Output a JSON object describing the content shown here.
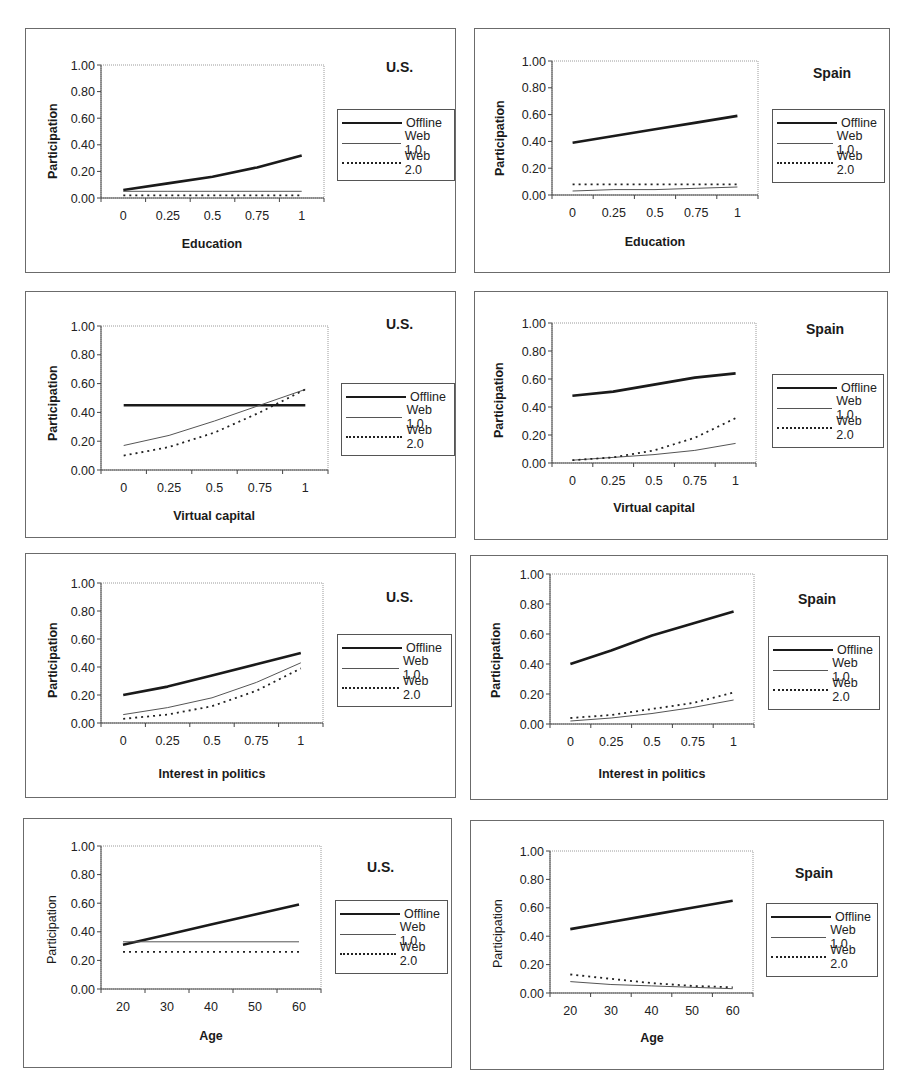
{
  "legend": {
    "offline": "Offline",
    "web1": "Web 1.0",
    "web2": "Web 2.0"
  },
  "colors": {
    "offline": "#1a1a1a",
    "web1": "#555555",
    "web2": "#222222",
    "panel_border": "#6b6b6b"
  },
  "panels": [
    {
      "country": "U.S.",
      "xlabel": "Education",
      "ylabel": "Participation"
    },
    {
      "country": "Spain",
      "xlabel": "Education",
      "ylabel": "Participation"
    },
    {
      "country": "U.S.",
      "xlabel": "Virtual capital",
      "ylabel": "Participation"
    },
    {
      "country": "Spain",
      "xlabel": "Virtual capital",
      "ylabel": "Participation"
    },
    {
      "country": "U.S.",
      "xlabel": "Interest in politics",
      "ylabel": "Participation"
    },
    {
      "country": "Spain",
      "xlabel": "Interest in politics",
      "ylabel": "Participation"
    },
    {
      "country": "U.S.",
      "xlabel": "Age",
      "ylabel": "Participation"
    },
    {
      "country": "Spain",
      "xlabel": "Age",
      "ylabel": "Participation"
    }
  ],
  "y_ticks": [
    "0.00",
    "0.20",
    "0.40",
    "0.60",
    "0.80",
    "1.00"
  ],
  "chart_data": [
    {
      "type": "line",
      "title": "U.S.",
      "xlabel": "Education",
      "ylabel": "Participation",
      "x": [
        0,
        0.25,
        0.5,
        0.75,
        1
      ],
      "x_tick_labels": [
        "0",
        "0.25",
        "0.5",
        "0.75",
        "1"
      ],
      "ylim": [
        0,
        1
      ],
      "legend_position": "right",
      "series": [
        {
          "name": "Offline",
          "values": [
            0.06,
            0.11,
            0.16,
            0.23,
            0.32
          ]
        },
        {
          "name": "Web 1.0",
          "values": [
            0.05,
            0.05,
            0.05,
            0.05,
            0.05
          ]
        },
        {
          "name": "Web 2.0",
          "values": [
            0.02,
            0.02,
            0.02,
            0.02,
            0.02
          ]
        }
      ]
    },
    {
      "type": "line",
      "title": "Spain",
      "xlabel": "Education",
      "ylabel": "Participation",
      "x": [
        0,
        0.25,
        0.5,
        0.75,
        1
      ],
      "x_tick_labels": [
        "0",
        "0.25",
        "0.5",
        "0.75",
        "1"
      ],
      "ylim": [
        0,
        1
      ],
      "legend_position": "right",
      "series": [
        {
          "name": "Offline",
          "values": [
            0.39,
            0.44,
            0.49,
            0.54,
            0.59
          ]
        },
        {
          "name": "Web 1.0",
          "values": [
            0.03,
            0.04,
            0.04,
            0.05,
            0.06
          ]
        },
        {
          "name": "Web 2.0",
          "values": [
            0.08,
            0.08,
            0.08,
            0.08,
            0.08
          ]
        }
      ]
    },
    {
      "type": "line",
      "title": "U.S.",
      "xlabel": "Virtual capital",
      "ylabel": "Participation",
      "x": [
        0,
        0.25,
        0.5,
        0.75,
        1
      ],
      "x_tick_labels": [
        "0",
        "0.25",
        "0.5",
        "0.75",
        "1"
      ],
      "ylim": [
        0,
        1
      ],
      "legend_position": "right",
      "series": [
        {
          "name": "Offline",
          "values": [
            0.45,
            0.45,
            0.45,
            0.45,
            0.45
          ]
        },
        {
          "name": "Web 1.0",
          "values": [
            0.17,
            0.24,
            0.34,
            0.45,
            0.56
          ]
        },
        {
          "name": "Web 2.0",
          "values": [
            0.1,
            0.16,
            0.26,
            0.4,
            0.56
          ]
        }
      ]
    },
    {
      "type": "line",
      "title": "Spain",
      "xlabel": "Virtual capital",
      "ylabel": "Participation",
      "x": [
        0,
        0.25,
        0.5,
        0.75,
        1
      ],
      "x_tick_labels": [
        "0",
        "0.25",
        "0.5",
        "0.75",
        "1"
      ],
      "ylim": [
        0,
        1
      ],
      "legend_position": "right",
      "series": [
        {
          "name": "Offline",
          "values": [
            0.48,
            0.51,
            0.56,
            0.61,
            0.64
          ]
        },
        {
          "name": "Web 1.0",
          "values": [
            0.02,
            0.04,
            0.06,
            0.09,
            0.14
          ]
        },
        {
          "name": "Web 2.0",
          "values": [
            0.02,
            0.04,
            0.09,
            0.18,
            0.32
          ]
        }
      ]
    },
    {
      "type": "line",
      "title": "U.S.",
      "xlabel": "Interest in politics",
      "ylabel": "Participation",
      "x": [
        0,
        0.25,
        0.5,
        0.75,
        1
      ],
      "x_tick_labels": [
        "0",
        "0.25",
        "0.5",
        "0.75",
        "1"
      ],
      "ylim": [
        0,
        1
      ],
      "legend_position": "right",
      "series": [
        {
          "name": "Offline",
          "values": [
            0.2,
            0.26,
            0.34,
            0.42,
            0.5
          ]
        },
        {
          "name": "Web 1.0",
          "values": [
            0.06,
            0.11,
            0.18,
            0.29,
            0.43
          ]
        },
        {
          "name": "Web 2.0",
          "values": [
            0.03,
            0.06,
            0.12,
            0.23,
            0.39
          ]
        }
      ]
    },
    {
      "type": "line",
      "title": "Spain",
      "xlabel": "Interest in politics",
      "ylabel": "Participation",
      "x": [
        0,
        0.25,
        0.5,
        0.75,
        1
      ],
      "x_tick_labels": [
        "0",
        "0.25",
        "0.5",
        "0.75",
        "1"
      ],
      "ylim": [
        0,
        1
      ],
      "legend_position": "right",
      "series": [
        {
          "name": "Offline",
          "values": [
            0.4,
            0.49,
            0.59,
            0.67,
            0.75
          ]
        },
        {
          "name": "Web 1.0",
          "values": [
            0.02,
            0.04,
            0.07,
            0.11,
            0.16
          ]
        },
        {
          "name": "Web 2.0",
          "values": [
            0.04,
            0.06,
            0.1,
            0.14,
            0.21
          ]
        }
      ]
    },
    {
      "type": "line",
      "title": "U.S.",
      "xlabel": "Age",
      "ylabel": "Participation",
      "x": [
        20,
        30,
        40,
        50,
        60
      ],
      "x_tick_labels": [
        "20",
        "30",
        "40",
        "50",
        "60"
      ],
      "ylim": [
        0,
        1
      ],
      "legend_position": "right",
      "series": [
        {
          "name": "Offline",
          "values": [
            0.31,
            0.38,
            0.45,
            0.52,
            0.59
          ]
        },
        {
          "name": "Web 1.0",
          "values": [
            0.33,
            0.33,
            0.33,
            0.33,
            0.33
          ]
        },
        {
          "name": "Web 2.0",
          "values": [
            0.26,
            0.26,
            0.26,
            0.26,
            0.26
          ]
        }
      ]
    },
    {
      "type": "line",
      "title": "Spain",
      "xlabel": "Age",
      "ylabel": "Participation",
      "x": [
        20,
        30,
        40,
        50,
        60
      ],
      "x_tick_labels": [
        "20",
        "30",
        "40",
        "50",
        "60"
      ],
      "ylim": [
        0,
        1
      ],
      "legend_position": "right",
      "series": [
        {
          "name": "Offline",
          "values": [
            0.45,
            0.5,
            0.55,
            0.6,
            0.65
          ]
        },
        {
          "name": "Web 1.0",
          "values": [
            0.08,
            0.06,
            0.05,
            0.04,
            0.03
          ]
        },
        {
          "name": "Web 2.0",
          "values": [
            0.13,
            0.1,
            0.07,
            0.05,
            0.04
          ]
        }
      ]
    }
  ]
}
